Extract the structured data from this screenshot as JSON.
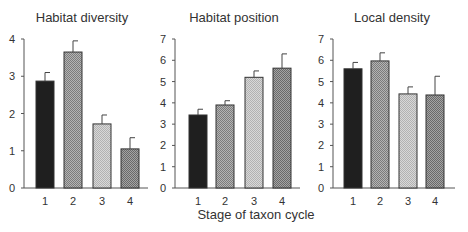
{
  "figure": {
    "xlabel": "Stage of taxon cycle",
    "fills": {
      "stage1": "#1f1f1f",
      "stage2": "#9c9c9c",
      "stage3": "#cacaca",
      "stage4": "#8a8a8a"
    }
  },
  "chart_data": [
    {
      "type": "bar",
      "title": "Habitat diversity",
      "xlabel": "",
      "ylabel": "",
      "categories": [
        "1",
        "2",
        "3",
        "4"
      ],
      "values": [
        2.87,
        3.65,
        1.72,
        1.05
      ],
      "error_upper": [
        3.1,
        3.95,
        1.96,
        1.35
      ],
      "ylim": [
        0,
        4
      ],
      "yticks": [
        0,
        1,
        2,
        3,
        4
      ],
      "grid": false
    },
    {
      "type": "bar",
      "title": "Habitat position",
      "xlabel": "",
      "ylabel": "",
      "categories": [
        "1",
        "2",
        "3",
        "4"
      ],
      "values": [
        3.43,
        3.9,
        5.2,
        5.63
      ],
      "error_upper": [
        3.7,
        4.1,
        5.5,
        6.3
      ],
      "ylim": [
        0,
        7
      ],
      "yticks": [
        0,
        1,
        2,
        3,
        4,
        5,
        6,
        7
      ],
      "grid": false
    },
    {
      "type": "bar",
      "title": "Local density",
      "xlabel": "",
      "ylabel": "",
      "categories": [
        "1",
        "2",
        "3",
        "4"
      ],
      "values": [
        5.6,
        5.97,
        4.42,
        4.37
      ],
      "error_upper": [
        5.9,
        6.35,
        4.75,
        5.25
      ],
      "ylim": [
        0,
        7
      ],
      "yticks": [
        0,
        1,
        2,
        3,
        4,
        5,
        6,
        7
      ],
      "grid": false
    }
  ],
  "shared_xlabel": "Stage of taxon cycle"
}
